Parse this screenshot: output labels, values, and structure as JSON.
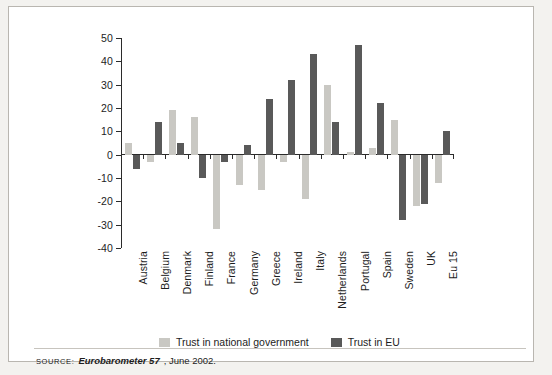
{
  "chart_data": {
    "type": "bar",
    "title": "",
    "subtitle": "",
    "xlabel": "",
    "ylabel": "",
    "ylim": [
      -40,
      50
    ],
    "ytick_step": 10,
    "yticks": [
      50,
      40,
      30,
      20,
      10,
      0,
      "-10",
      "-20",
      "-30",
      "-40"
    ],
    "grid": false,
    "legend_position": "bottom",
    "categories": [
      "Austria",
      "Belgium",
      "Denmark",
      "Finland",
      "France",
      "Germany",
      "Greece",
      "Ireland",
      "Italy",
      "Netherlands",
      "Portugal",
      "Spain",
      "Sweden",
      "UK",
      "Eu 15"
    ],
    "series": [
      {
        "name": "Trust in national government",
        "color": "#c9c8c3",
        "values": [
          5,
          -3,
          19,
          16,
          -32,
          -13,
          -15,
          -3,
          -19,
          30,
          1,
          3,
          15,
          -22,
          -12
        ]
      },
      {
        "name": "Trust in EU",
        "color": "#595959",
        "values": [
          -6,
          14,
          5,
          -10,
          -3,
          4,
          24,
          32,
          43,
          14,
          47,
          22,
          -28,
          -21,
          10
        ]
      }
    ]
  },
  "legend": {
    "items": [
      {
        "label": "Trust in national government",
        "swatch": "light"
      },
      {
        "label": "Trust in EU",
        "swatch": "dark"
      }
    ]
  },
  "source": {
    "label": "SOURCE:",
    "publication": "Eurobarometer 57",
    "rest": ", June 2002."
  }
}
